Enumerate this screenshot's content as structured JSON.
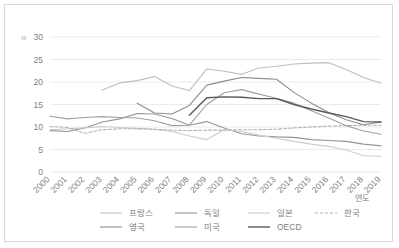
{
  "chart_data": {
    "type": "line",
    "title": "",
    "xlabel": "연도",
    "ylabel": "%",
    "ylim": [
      0,
      30
    ],
    "yticks": [
      0,
      5,
      10,
      15,
      20,
      25,
      30
    ],
    "grid": true,
    "legend_position": "bottom",
    "categories": [
      "2000",
      "2001",
      "2002",
      "2003",
      "2004",
      "2005",
      "2006",
      "2007",
      "2008",
      "2009",
      "2010",
      "2011",
      "2012",
      "2013",
      "2014",
      "2015",
      "2016",
      "2017",
      "2018",
      "2019"
    ],
    "series": [
      {
        "name": "프랑스",
        "color": "#bfbfbf",
        "dash": "none",
        "width": 1.1,
        "values": [
          null,
          null,
          null,
          18.2,
          19.8,
          20.3,
          21.2,
          19.1,
          18.1,
          22.9,
          22.4,
          21.7,
          23.1,
          23.5,
          24.0,
          24.2,
          24.3,
          22.8,
          21.0,
          19.7
        ]
      },
      {
        "name": "독일",
        "color": "#969696",
        "dash": "none",
        "width": 1.1,
        "values": [
          9.2,
          9.0,
          9.8,
          11.1,
          11.8,
          13.0,
          12.9,
          11.9,
          10.4,
          11.2,
          9.8,
          8.5,
          8.0,
          7.8,
          7.7,
          7.2,
          7.0,
          6.8,
          6.2,
          5.8
        ]
      },
      {
        "name": "일본",
        "color": "#cccccc",
        "dash": "none",
        "width": 1.1,
        "values": [
          9.4,
          9.6,
          9.8,
          10.1,
          9.9,
          9.7,
          9.5,
          9.0,
          8.0,
          7.2,
          9.4,
          9.0,
          8.2,
          7.5,
          6.8,
          6.2,
          5.7,
          4.9,
          3.6,
          3.5
        ]
      },
      {
        "name": "한국",
        "color": "#b3b3b3",
        "dash": "3,2",
        "width": 1.1,
        "values": [
          10.1,
          9.9,
          8.6,
          9.4,
          9.6,
          9.6,
          9.5,
          9.3,
          9.2,
          9.3,
          9.3,
          9.4,
          9.4,
          9.5,
          9.8,
          10.0,
          10.2,
          10.3,
          10.4,
          10.4
        ]
      },
      {
        "name": "영국",
        "color": "#8c8c8c",
        "dash": "none",
        "width": 1.1,
        "values": [
          null,
          null,
          null,
          null,
          null,
          15.3,
          13.1,
          12.9,
          14.8,
          19.3,
          20.2,
          21.0,
          20.8,
          20.6,
          17.7,
          15.3,
          13.2,
          11.6,
          10.5,
          11.1
        ]
      },
      {
        "name": "미국",
        "color": "#a0a0a0",
        "dash": "none",
        "width": 1.1,
        "values": [
          12.4,
          11.8,
          12.1,
          12.3,
          12.1,
          12.0,
          11.4,
          10.3,
          10.4,
          15.0,
          17.6,
          18.3,
          17.3,
          16.4,
          15.3,
          13.6,
          12.0,
          10.3,
          9.1,
          8.4
        ]
      },
      {
        "name": "OECD",
        "color": "#595959",
        "dash": "none",
        "width": 1.4,
        "values": [
          null,
          null,
          null,
          null,
          null,
          null,
          null,
          null,
          12.6,
          16.5,
          16.7,
          16.6,
          16.3,
          16.3,
          15.0,
          14.0,
          13.1,
          12.3,
          11.2,
          11.1
        ]
      }
    ]
  }
}
